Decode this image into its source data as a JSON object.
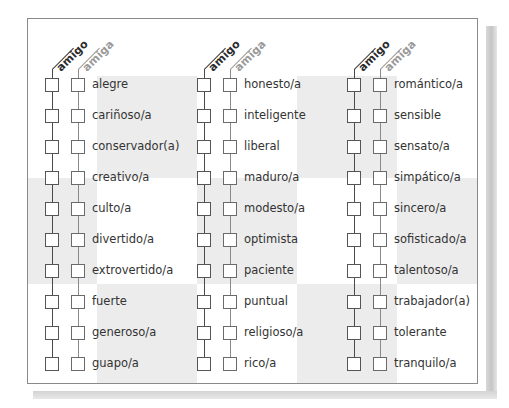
{
  "headers": {
    "amigo": "amigo",
    "amiga": "amiga"
  },
  "colors": {
    "shade": "#ececec",
    "frame": "#8a8a8a",
    "amigo_line": "#3a3a3a",
    "amiga_line": "#9a9a9a"
  },
  "columns": [
    {
      "items": [
        "alegre",
        "cariñoso/a",
        "conservador(a)",
        "creativo/a",
        "culto/a",
        "divertido/a",
        "extrovertido/a",
        "fuerte",
        "generoso/a",
        "guapo/a"
      ]
    },
    {
      "items": [
        "honesto/a",
        "inteligente",
        "liberal",
        "maduro/a",
        "modesto/a",
        "optimista",
        "paciente",
        "puntual",
        "religioso/a",
        "rico/a"
      ]
    },
    {
      "items": [
        "romántico/a",
        "sensible",
        "sensato/a",
        "simpático/a",
        "sincero/a",
        "sofisticado/a",
        "talentoso/a",
        "trabajador(a)",
        "tolerante",
        "tranquilo/a"
      ]
    }
  ]
}
